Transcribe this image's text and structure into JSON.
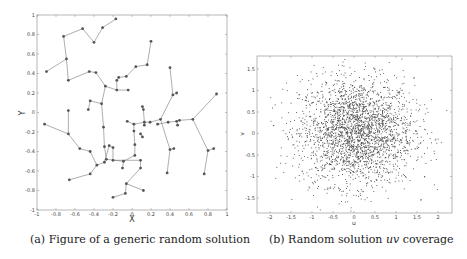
{
  "chart_data": [
    {
      "type": "line",
      "subtype": "network-tree",
      "title": "",
      "caption": "(a) Figure of a generic random solution",
      "xlabel": "X",
      "ylabel": "Y",
      "xlim": [
        -1,
        1
      ],
      "ylim": [
        -1,
        1
      ],
      "xticks": [
        "-1",
        "-0.8",
        "-0.6",
        "-0.4",
        "-0.2",
        "0",
        "0.2",
        "0.4",
        "0.6",
        "0.8",
        "1"
      ],
      "yticks": [
        "-1",
        "-0.8",
        "-0.6",
        "-0.4",
        "-0.2",
        "0",
        "0.2",
        "0.4",
        "0.6",
        "0.8",
        "1"
      ],
      "grid": false,
      "marker": "filled-circle",
      "edges": [
        [
          [
            -0.9,
            0.42
          ],
          [
            -0.69,
            0.55
          ]
        ],
        [
          [
            -0.69,
            0.55
          ],
          [
            -0.72,
            0.78
          ]
        ],
        [
          [
            -0.72,
            0.78
          ],
          [
            -0.52,
            0.86
          ]
        ],
        [
          [
            -0.52,
            0.86
          ],
          [
            -0.4,
            0.72
          ]
        ],
        [
          [
            -0.4,
            0.72
          ],
          [
            -0.31,
            0.87
          ]
        ],
        [
          [
            -0.31,
            0.87
          ],
          [
            -0.17,
            0.96
          ]
        ],
        [
          [
            -0.69,
            0.55
          ],
          [
            -0.67,
            0.33
          ]
        ],
        [
          [
            -0.67,
            0.33
          ],
          [
            -0.45,
            0.42
          ]
        ],
        [
          [
            -0.45,
            0.42
          ],
          [
            -0.38,
            0.41
          ]
        ],
        [
          [
            -0.38,
            0.41
          ],
          [
            -0.28,
            0.27
          ]
        ],
        [
          [
            -0.28,
            0.27
          ],
          [
            -0.16,
            0.23
          ]
        ],
        [
          [
            -0.16,
            0.23
          ],
          [
            -0.16,
            0.33
          ]
        ],
        [
          [
            -0.16,
            0.33
          ],
          [
            -0.14,
            0.36
          ]
        ],
        [
          [
            -0.14,
            0.36
          ],
          [
            -0.06,
            0.37
          ]
        ],
        [
          [
            -0.06,
            0.37
          ],
          [
            0.04,
            0.47
          ]
        ],
        [
          [
            0.04,
            0.47
          ],
          [
            0.16,
            0.49
          ]
        ],
        [
          [
            0.16,
            0.49
          ],
          [
            0.2,
            0.73
          ]
        ],
        [
          [
            -0.16,
            0.23
          ],
          [
            -0.04,
            0.23
          ]
        ],
        [
          [
            -0.28,
            0.27
          ],
          [
            -0.32,
            0.09
          ]
        ],
        [
          [
            -0.32,
            0.09
          ],
          [
            -0.44,
            0.12
          ]
        ],
        [
          [
            -0.44,
            0.12
          ],
          [
            -0.46,
            0.03
          ]
        ],
        [
          [
            -0.32,
            0.09
          ],
          [
            -0.3,
            -0.15
          ]
        ],
        [
          [
            -0.3,
            -0.15
          ],
          [
            -0.29,
            -0.35
          ]
        ],
        [
          [
            -0.29,
            -0.35
          ],
          [
            -0.27,
            -0.48
          ]
        ],
        [
          [
            -0.27,
            -0.48
          ],
          [
            -0.09,
            -0.5
          ]
        ],
        [
          [
            -0.09,
            -0.5
          ],
          [
            -0.1,
            -0.57
          ]
        ],
        [
          [
            -0.09,
            -0.5
          ],
          [
            0.03,
            -0.44
          ]
        ],
        [
          [
            0.03,
            -0.44
          ],
          [
            0.03,
            -0.33
          ]
        ],
        [
          [
            0.03,
            -0.33
          ],
          [
            0.02,
            -0.19
          ]
        ],
        [
          [
            0.02,
            -0.19
          ],
          [
            0.02,
            -0.12
          ]
        ],
        [
          [
            0.02,
            -0.12
          ],
          [
            -0.05,
            -0.09
          ]
        ],
        [
          [
            0.02,
            -0.12
          ],
          [
            0.13,
            -0.1
          ]
        ],
        [
          [
            0.13,
            -0.1
          ],
          [
            0.13,
            -0.13
          ]
        ],
        [
          [
            0.13,
            -0.1
          ],
          [
            0.12,
            0.03
          ]
        ],
        [
          [
            0.12,
            0.03
          ],
          [
            0.11,
            0.06
          ]
        ],
        [
          [
            0.13,
            -0.1
          ],
          [
            0.19,
            -0.1
          ]
        ],
        [
          [
            0.19,
            -0.1
          ],
          [
            0.3,
            -0.07
          ]
        ],
        [
          [
            0.3,
            -0.07
          ],
          [
            0.43,
            0.18
          ]
        ],
        [
          [
            0.43,
            0.18
          ],
          [
            0.47,
            0.2
          ]
        ],
        [
          [
            0.43,
            0.18
          ],
          [
            0.4,
            0.46
          ]
        ],
        [
          [
            0.3,
            -0.07
          ],
          [
            0.4,
            -0.38
          ]
        ],
        [
          [
            0.4,
            -0.38
          ],
          [
            0.44,
            -0.37
          ]
        ],
        [
          [
            0.4,
            -0.38
          ],
          [
            0.37,
            -0.62
          ]
        ],
        [
          [
            -0.92,
            -0.12
          ],
          [
            -0.67,
            -0.22
          ]
        ],
        [
          [
            -0.67,
            -0.22
          ],
          [
            -0.67,
            0.02
          ]
        ],
        [
          [
            -0.67,
            -0.22
          ],
          [
            -0.55,
            -0.37
          ]
        ],
        [
          [
            -0.55,
            -0.37
          ],
          [
            -0.44,
            -0.4
          ]
        ],
        [
          [
            -0.44,
            -0.4
          ],
          [
            -0.37,
            -0.54
          ]
        ],
        [
          [
            -0.37,
            -0.54
          ],
          [
            -0.29,
            -0.51
          ]
        ],
        [
          [
            -0.29,
            -0.51
          ],
          [
            -0.24,
            -0.34
          ]
        ],
        [
          [
            -0.24,
            -0.34
          ],
          [
            -0.2,
            -0.36
          ]
        ],
        [
          [
            -0.37,
            -0.54
          ],
          [
            -0.44,
            -0.63
          ]
        ],
        [
          [
            -0.44,
            -0.63
          ],
          [
            -0.66,
            -0.69
          ]
        ],
        [
          [
            -0.2,
            -0.36
          ],
          [
            -0.2,
            -0.49
          ]
        ],
        [
          [
            -0.2,
            -0.49
          ],
          [
            0.09,
            -0.49
          ]
        ],
        [
          [
            0.09,
            -0.49
          ],
          [
            0.09,
            -0.57
          ]
        ],
        [
          [
            0.09,
            -0.57
          ],
          [
            -0.06,
            -0.73
          ]
        ],
        [
          [
            -0.06,
            -0.73
          ],
          [
            0.12,
            -0.8
          ]
        ],
        [
          [
            -0.06,
            -0.73
          ],
          [
            -0.07,
            -0.83
          ]
        ],
        [
          [
            -0.07,
            -0.83
          ],
          [
            -0.2,
            -0.87
          ]
        ],
        [
          [
            0.09,
            -0.22
          ],
          [
            0.11,
            -0.25
          ]
        ],
        [
          [
            0.27,
            -0.12
          ],
          [
            0.38,
            -0.1
          ]
        ],
        [
          [
            0.38,
            -0.1
          ],
          [
            0.47,
            -0.09
          ]
        ],
        [
          [
            0.47,
            -0.09
          ],
          [
            0.5,
            -0.08
          ]
        ],
        [
          [
            0.5,
            -0.08
          ],
          [
            0.64,
            -0.07
          ]
        ],
        [
          [
            0.64,
            -0.07
          ],
          [
            0.8,
            -0.39
          ]
        ],
        [
          [
            0.8,
            -0.39
          ],
          [
            0.86,
            -0.37
          ]
        ],
        [
          [
            0.8,
            -0.39
          ],
          [
            0.76,
            -0.63
          ]
        ],
        [
          [
            0.47,
            -0.09
          ],
          [
            0.48,
            -0.13
          ]
        ],
        [
          [
            0.64,
            -0.07
          ],
          [
            0.89,
            0.19
          ]
        ]
      ]
    },
    {
      "type": "scatter",
      "title": "",
      "caption_prefix": "(b) Random solution ",
      "caption_math": "uv",
      "caption_suffix": " coverage",
      "xlabel": "u",
      "ylabel": "v",
      "xlim": [
        -2.3,
        2.3
      ],
      "ylim": [
        -1.85,
        1.85
      ],
      "xticks": [
        "-2",
        "-1.5",
        "-1",
        "-0.5",
        "0",
        "0.5",
        "1",
        "1.5",
        "2"
      ],
      "yticks": [
        "-1.5",
        "-1",
        "-0.5",
        "0",
        "0.5",
        "1",
        "1.5"
      ],
      "grid": false,
      "marker": "small-dot",
      "distribution": "approximately Gaussian cloud centered near (0,0), sigma ~0.65, ~3000 points, denser at center"
    }
  ],
  "captions": {
    "a": "(a) Figure of a generic random solution",
    "b_prefix": "(b) Random solution ",
    "b_math": "uv",
    "b_suffix": " coverage"
  }
}
